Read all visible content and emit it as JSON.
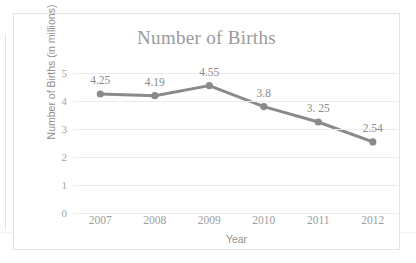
{
  "chart_data": {
    "type": "line",
    "title": "Number of Births",
    "xlabel": "Year",
    "ylabel": "Number of Births (in millions)",
    "categories": [
      "2007",
      "2008",
      "2009",
      "2010",
      "2011",
      "2012"
    ],
    "values": [
      4.25,
      4.19,
      4.55,
      3.8,
      3.25,
      2.54
    ],
    "point_labels": [
      "4.25",
      "4.19",
      "4.55",
      "3.8",
      "3. 25",
      "2.54"
    ],
    "ylim": [
      0,
      5
    ],
    "yticks": [
      "0",
      "1",
      "2",
      "3",
      "4",
      "5"
    ],
    "grid": true,
    "legend": "none",
    "series_color": "#8a8a8a",
    "marker": "circle",
    "title_color": "#9a9a9a",
    "gridline_color": "#ececec",
    "frame_color": "#e3e3e3",
    "background": "#ffffff"
  }
}
